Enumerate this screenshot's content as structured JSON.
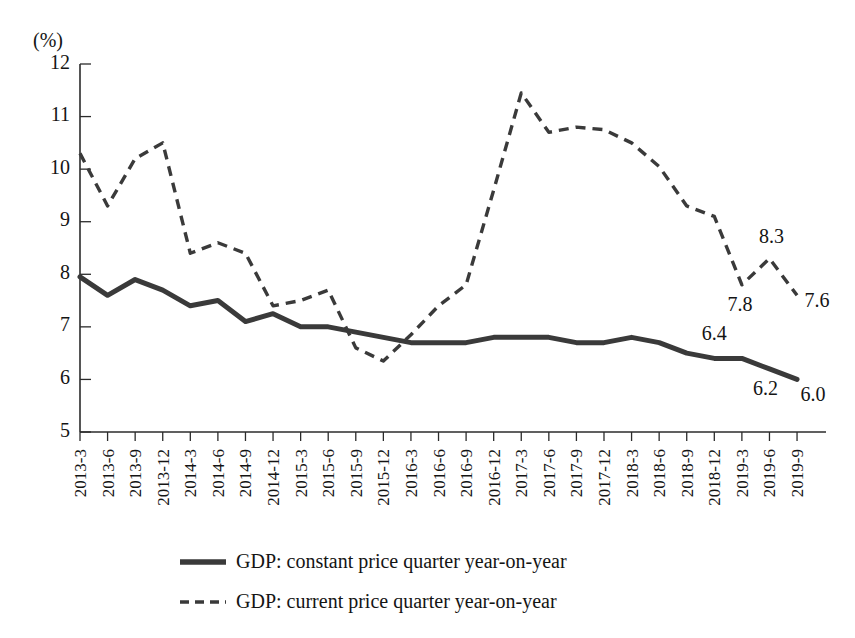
{
  "chart_data": {
    "type": "line",
    "title": "",
    "subtitle": "",
    "xlabel": "",
    "ylabel": "",
    "unit_label": "(%)",
    "ylim": [
      5,
      12
    ],
    "ytick_labels": [
      "5",
      "6",
      "7",
      "8",
      "9",
      "10",
      "11",
      "12"
    ],
    "ytick_values": [
      5,
      6,
      7,
      8,
      9,
      10,
      11,
      12
    ],
    "grid": false,
    "legend_position": "bottom",
    "categories": [
      "2013-3",
      "2013-6",
      "2013-9",
      "2013-12",
      "2014-3",
      "2014-6",
      "2014-9",
      "2014-12",
      "2015-3",
      "2015-6",
      "2015-9",
      "2015-12",
      "2016-3",
      "2016-6",
      "2016-9",
      "2016-12",
      "2017-3",
      "2017-6",
      "2017-9",
      "2017-12",
      "2018-3",
      "2018-6",
      "2018-9",
      "2018-12",
      "2019-3",
      "2019-6",
      "2019-9"
    ],
    "series": [
      {
        "name": "GDP: constant price quarter year-on-year",
        "style": "solid",
        "values": [
          7.95,
          7.6,
          7.9,
          7.7,
          7.4,
          7.5,
          7.1,
          7.25,
          7.0,
          7.0,
          6.9,
          6.8,
          6.7,
          6.7,
          6.7,
          6.8,
          6.8,
          6.8,
          6.7,
          6.7,
          6.8,
          6.7,
          6.5,
          6.4,
          6.4,
          6.2,
          6.0
        ]
      },
      {
        "name": "GDP: current price quarter year-on-year",
        "style": "dashed",
        "values": [
          10.3,
          9.3,
          10.2,
          10.5,
          8.4,
          8.6,
          8.4,
          7.4,
          7.5,
          7.7,
          6.6,
          6.35,
          6.85,
          7.4,
          7.8,
          9.6,
          11.45,
          10.7,
          10.8,
          10.75,
          10.5,
          10.05,
          9.3,
          9.1,
          7.8,
          8.3,
          7.6
        ]
      }
    ],
    "point_labels": [
      {
        "series": 0,
        "index": 23,
        "text": "6.4",
        "dx": 0,
        "dy": -18
      },
      {
        "series": 0,
        "index": 25,
        "text": "6.2",
        "dx": -4,
        "dy": 26
      },
      {
        "series": 0,
        "index": 26,
        "text": "6.0",
        "dx": 16,
        "dy": 22
      },
      {
        "series": 1,
        "index": 24,
        "text": "7.8",
        "dx": -2,
        "dy": 26
      },
      {
        "series": 1,
        "index": 25,
        "text": "8.3",
        "dx": 2,
        "dy": -16
      },
      {
        "series": 1,
        "index": 26,
        "text": "7.6",
        "dx": 20,
        "dy": 12
      }
    ],
    "legend": [
      {
        "label": "GDP: constant price quarter year-on-year",
        "style": "solid"
      },
      {
        "label": "GDP: current price quarter year-on-year",
        "style": "dashed"
      }
    ],
    "colors": {
      "line": "#3a3a3a",
      "axis": "#2b2b2b",
      "text": "#141414",
      "background": "#ffffff"
    }
  }
}
